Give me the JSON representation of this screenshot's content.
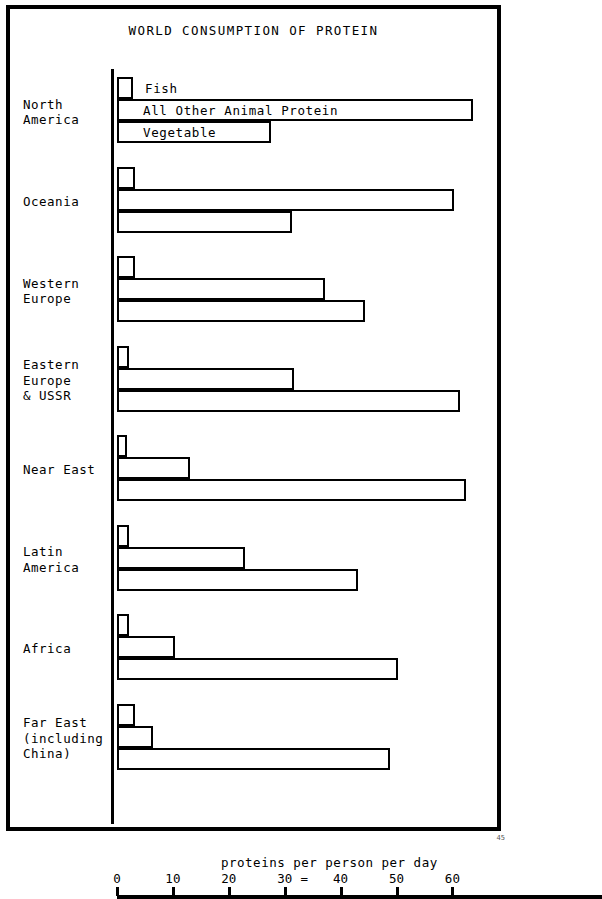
{
  "figure": {
    "title": "WORLD CONSUMPTION OF PROTEIN",
    "axis_caption": "proteins per person per day",
    "equals_mark": "=",
    "corner_mark": "45"
  },
  "chart_data": {
    "type": "bar",
    "orientation": "horizontal",
    "title": "WORLD CONSUMPTION OF PROTEIN",
    "xlabel": "proteins per person per day",
    "ylabel": "",
    "xlim": [
      0,
      68
    ],
    "xticks": [
      0,
      10,
      20,
      30,
      40,
      50,
      60
    ],
    "xtick_labels": [
      "0",
      "10",
      "20",
      "30",
      "40",
      "50",
      "60"
    ],
    "grid": false,
    "legend_position": "inline-first-group",
    "categories": [
      "North\nAmerica",
      "Oceania",
      "Western\nEurope",
      "Eastern\nEurope\n& USSR",
      "Near East",
      "Latin\nAmerica",
      "Africa",
      "Far East\n(including\nChina)"
    ],
    "series": [
      {
        "name": "Fish",
        "values": [
          2.8,
          3.2,
          3.2,
          2.1,
          1.7,
          2.1,
          2.1,
          3.2
        ]
      },
      {
        "name": "All Other Animal Protein",
        "values": [
          63.7,
          60.3,
          37.2,
          31.7,
          13.0,
          22.9,
          10.3,
          6.4
        ]
      },
      {
        "name": "Vegetable",
        "values": [
          27.6,
          31.3,
          44.3,
          61.4,
          62.5,
          43.1,
          50.3,
          48.9
        ]
      }
    ]
  }
}
